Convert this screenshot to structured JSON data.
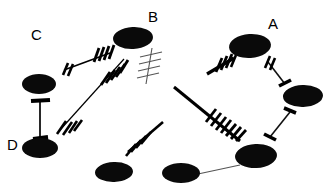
{
  "figure": {
    "type": "scientific-diagram",
    "title": "",
    "background_color": "#ffffff",
    "ink_color": "#000000",
    "width": 327,
    "height": 191,
    "labels": [
      {
        "id": "label-a",
        "text": "A",
        "x": 268,
        "y": 16
      },
      {
        "id": "label-b",
        "text": "B",
        "x": 148,
        "y": 9
      },
      {
        "id": "label-c",
        "text": "C",
        "x": 31,
        "y": 27
      },
      {
        "id": "label-d",
        "text": "D",
        "x": 7,
        "y": 137
      }
    ],
    "ellipses": [
      {
        "id": "ellipse-c",
        "cx": 39,
        "cy": 84,
        "rx": 17,
        "ry": 10,
        "rot": 0
      },
      {
        "id": "ellipse-d",
        "cx": 40,
        "cy": 148,
        "rx": 18,
        "ry": 10,
        "rot": 0
      },
      {
        "id": "ellipse-b",
        "cx": 133,
        "cy": 38,
        "rx": 20,
        "ry": 11,
        "rot": -3
      },
      {
        "id": "ellipse-bottom-left",
        "cx": 114,
        "cy": 172,
        "rx": 19,
        "ry": 10,
        "rot": -2
      },
      {
        "id": "ellipse-bottom-mid",
        "cx": 181,
        "cy": 173,
        "rx": 19,
        "ry": 10,
        "rot": 0
      },
      {
        "id": "ellipse-a",
        "cx": 250,
        "cy": 46,
        "rx": 21,
        "ry": 12,
        "rot": -4
      },
      {
        "id": "ellipse-right",
        "cx": 303,
        "cy": 96,
        "rx": 20,
        "ry": 11,
        "rot": -2
      },
      {
        "id": "ellipse-bottom-right",
        "cx": 256,
        "cy": 156,
        "rx": 21,
        "ry": 12,
        "rot": -3
      }
    ],
    "connectors": [
      {
        "id": "connector-c-d",
        "from": "ellipse-c",
        "to": "ellipse-d",
        "style": "dumbbell",
        "stroke": 2.2,
        "ticks": 2
      },
      {
        "id": "connector-c-b",
        "from": "ellipse-c-region",
        "to": "ellipse-b",
        "style": "hashed",
        "stroke": 2.4,
        "ticks": 6
      },
      {
        "id": "connector-d-b",
        "from": "ellipse-d-region",
        "to": "ellipse-b",
        "style": "hashed-ends",
        "stroke": 1.4,
        "ticks": 8
      },
      {
        "id": "connector-b-comb",
        "from": "ellipse-b",
        "to": "free",
        "style": "thin-comb",
        "stroke": 1.0,
        "ticks": 5
      },
      {
        "id": "connector-center",
        "from": "free",
        "to": "ellipse-bottom-right",
        "style": "hashed",
        "stroke": 3.0,
        "ticks": 9
      },
      {
        "id": "connector-a-left",
        "from": "free",
        "to": "ellipse-a",
        "style": "hashed",
        "stroke": 3.0,
        "ticks": 5
      },
      {
        "id": "connector-a-right",
        "from": "ellipse-a",
        "to": "ellipse-right",
        "style": "dumbbell",
        "stroke": 2.2,
        "ticks": 3
      },
      {
        "id": "connector-r-br",
        "from": "ellipse-right",
        "to": "ellipse-bottom-right",
        "style": "dumbbell",
        "stroke": 2.0,
        "ticks": 2
      },
      {
        "id": "connector-mid",
        "from": "free",
        "to": "free",
        "style": "hashed",
        "stroke": 2.6,
        "ticks": 5
      },
      {
        "id": "connector-bottom",
        "from": "ellipse-bottom-mid",
        "to": "ellipse-bottom-right",
        "style": "plain-thin",
        "stroke": 1.2,
        "ticks": 0
      }
    ]
  }
}
